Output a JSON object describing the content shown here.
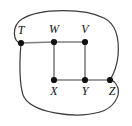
{
  "figure": {
    "kind": "undirected-graph-diagram",
    "width": 132,
    "height": 126,
    "background_color": "#ffffff",
    "straight_edge_color": "#808080",
    "curved_edge_color": "#3a3a3a",
    "vertex_color": "#111111",
    "label_color": "#111111"
  },
  "vertices": [
    {
      "id": "T",
      "label": "T",
      "x": 21,
      "y": 43,
      "label_x": 21,
      "label_y": 34,
      "radius": 3.1
    },
    {
      "id": "W",
      "label": "W",
      "x": 54,
      "y": 42,
      "label_x": 54,
      "label_y": 33,
      "radius": 3.1
    },
    {
      "id": "V",
      "label": "V",
      "x": 85,
      "y": 42,
      "label_x": 85,
      "label_y": 33,
      "radius": 3.1
    },
    {
      "id": "X",
      "label": "X",
      "x": 54,
      "y": 80,
      "label_x": 54,
      "label_y": 95,
      "radius": 3.1
    },
    {
      "id": "Y",
      "label": "Y",
      "x": 85,
      "y": 80,
      "label_x": 85,
      "label_y": 95,
      "radius": 3.1
    },
    {
      "id": "Z",
      "label": "Z",
      "x": 110,
      "y": 80,
      "label_x": 112,
      "label_y": 95,
      "radius": 3.1
    }
  ],
  "edges": [
    {
      "id": "T-W",
      "from": "T",
      "to": "W",
      "style": "straight",
      "path": "M 21 43 L 54 42"
    },
    {
      "id": "W-V",
      "from": "W",
      "to": "V",
      "style": "straight",
      "path": "M 54 42 L 85 42"
    },
    {
      "id": "W-X",
      "from": "W",
      "to": "X",
      "style": "straight",
      "path": "M 54 42 L 54 80"
    },
    {
      "id": "V-Y",
      "from": "V",
      "to": "Y",
      "style": "straight",
      "path": "M 85 42 L 85 80"
    },
    {
      "id": "X-Y",
      "from": "X",
      "to": "Y",
      "style": "straight",
      "path": "M 54 80 L 85 80"
    },
    {
      "id": "Y-Z",
      "from": "Y",
      "to": "Z",
      "style": "straight",
      "path": "M 85 80 L 110 80"
    },
    {
      "id": "T-Z-top",
      "from": "T",
      "to": "Z",
      "style": "curved-over-top",
      "path": "M 21 43 C 13 43 11 26 22 19 C 40 8 84 8 104 18 C 118 25 119 44 118 56 C 117 66 113 75 110 80"
    },
    {
      "id": "T-Z-bottom",
      "from": "T",
      "to": "Z",
      "style": "curved-under-bottom",
      "path": "M 21 43 C 20 56 18 78 23 95 C 30 113 75 119 100 112 C 114 108 120 96 118 88 C 116 83 113 80 110 80"
    }
  ],
  "vertex_count": 6,
  "edge_count": 8
}
